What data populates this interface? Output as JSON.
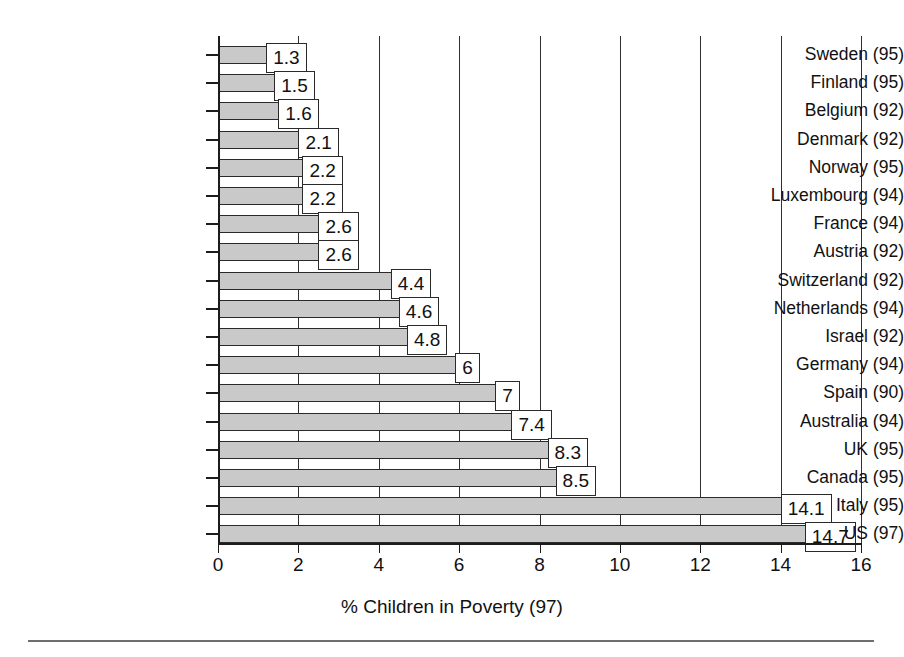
{
  "chart_data": {
    "type": "bar",
    "orientation": "horizontal",
    "title": "",
    "xlabel": "% Children in Poverty (97)",
    "ylabel": "",
    "xlim": [
      0,
      16
    ],
    "xticks": [
      0,
      2,
      4,
      6,
      8,
      10,
      12,
      14,
      16
    ],
    "xtick_labels": [
      "0",
      "2",
      "4",
      "6",
      "8",
      "10",
      "12",
      "14",
      "16"
    ],
    "grid": true,
    "grid_axis": "x",
    "legend": false,
    "bar_fill_color": "#c9c9c9",
    "bar_edge_color": "#2a2a2a",
    "categories": [
      "Sweden (95)",
      "Finland (95)",
      "Belgium (92)",
      "Denmark (92)",
      "Norway (95)",
      "Luxembourg (94)",
      "France (94)",
      "Austria (92)",
      "Switzerland (92)",
      "Netherlands (94)",
      "Israel (92)",
      "Germany (94)",
      "Spain (90)",
      "Australia (94)",
      "UK (95)",
      "Canada (95)",
      "Italy (95)",
      "US (97)"
    ],
    "values": [
      1.3,
      1.5,
      1.6,
      2.1,
      2.2,
      2.2,
      2.6,
      2.6,
      4.4,
      4.6,
      4.8,
      6,
      7,
      7.4,
      8.3,
      8.5,
      14.1,
      14.7
    ],
    "data_labels": [
      "1.3",
      "1.5",
      "1.6",
      "2.1",
      "2.2",
      "2.2",
      "2.6",
      "2.6",
      "4.4",
      "4.6",
      "4.8",
      "6",
      "7",
      "7.4",
      "8.3",
      "8.5",
      "14.1",
      "14.7"
    ]
  }
}
